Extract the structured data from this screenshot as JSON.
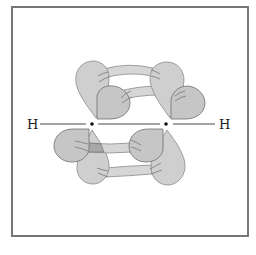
{
  "diagram": {
    "labels": {
      "left_atom": "H",
      "right_atom": "H"
    },
    "colors": {
      "frame": "#767676",
      "lobe_fill": "#cfcfcf",
      "lobe_stroke": "#8a8a8a",
      "dark_lobe_fill": "#bdbdbd",
      "band_fill": "#d6d6d6",
      "line": "#333333"
    },
    "nodes": [
      {
        "id": "H-left",
        "label": "H"
      },
      {
        "id": "C1",
        "label": ""
      },
      {
        "id": "C2",
        "label": ""
      },
      {
        "id": "H-right",
        "label": "H"
      }
    ],
    "bonds": [
      {
        "from": "H-left",
        "to": "C1",
        "type": "sigma"
      },
      {
        "from": "C1",
        "to": "C2",
        "type": "sigma"
      },
      {
        "from": "C2",
        "to": "H-right",
        "type": "sigma"
      },
      {
        "from": "C1",
        "to": "C2",
        "type": "pi",
        "plane": "vertical"
      },
      {
        "from": "C1",
        "to": "C2",
        "type": "pi",
        "plane": "horizontal"
      }
    ]
  }
}
